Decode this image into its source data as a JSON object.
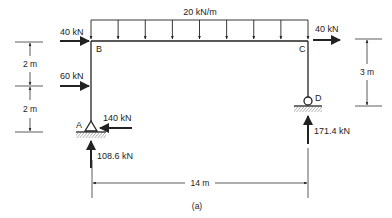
{
  "diagram": {
    "caption": "(a)",
    "nodes": {
      "A": "A",
      "B": "B",
      "C": "C",
      "D": "D"
    },
    "loads": {
      "distributed": "20 kN/m",
      "top_left_horizontal": "40 kN",
      "mid_left_horizontal": "60 kN",
      "top_right_horizontal": "40 kN"
    },
    "reactions": {
      "A_horizontal": "140 kN",
      "A_vertical": "108.6 kN",
      "D_vertical": "171.4 kN"
    },
    "dimensions": {
      "left_upper": "2 m",
      "left_lower": "2 m",
      "right": "3 m",
      "span": "14 m"
    },
    "supports": {
      "A": "pin",
      "D": "roller"
    },
    "distributed_load_arrow_count": 9
  }
}
